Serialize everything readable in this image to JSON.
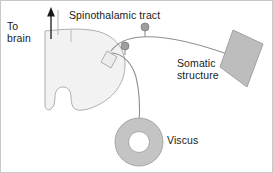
{
  "figure": {
    "width": 273,
    "height": 173
  },
  "labels": {
    "to_brain": "To\nbrain",
    "spinothalamic_tract": "Spinothalamic tract",
    "somatic_structure": "Somatic\nstructure",
    "viscus": "Viscus"
  },
  "colors": {
    "outline": "#8c8c8c",
    "text": "#1a1a1a",
    "arrow": "#1a1a1a",
    "cord_fill": "#f2f2f2",
    "cord_stroke": "#a6a6a6",
    "somatic_fill": "#bdbdbd",
    "somatic_stroke": "#9a9a9a",
    "viscus_fill": "#c4c4c4",
    "viscus_stroke": "#a0a0a0",
    "neuron_fill": "#9e9e9e",
    "neuron_stroke": "#7d7d7d",
    "nerve_stroke": "#8f8f8f",
    "border": "#c8c8c8",
    "background": "#ffffff"
  },
  "icons": {
    "ascending_arrow": "arrow-up-icon",
    "spinal_cord": "spinal-cord-icon",
    "viscus": "viscus-ring-icon",
    "somatic": "somatic-structure-icon",
    "neuron_somatic": "neuron-cell-body-icon",
    "neuron_visceral": "neuron-cell-body-icon",
    "dorsal_horn": "dorsal-horn-icon"
  }
}
